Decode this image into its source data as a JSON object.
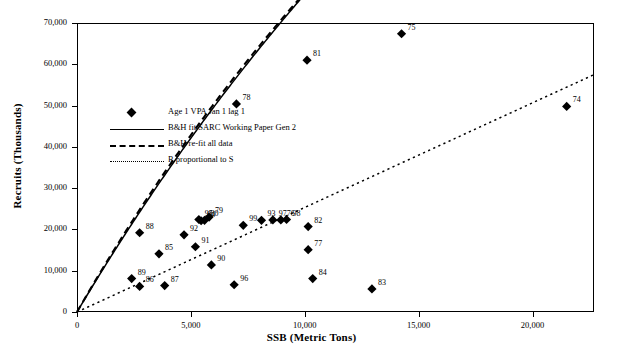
{
  "chart_data": {
    "type": "scatter",
    "title": "",
    "xlabel": "SSB (Metric Tons)",
    "ylabel": "Recruits (Thousands)",
    "xlim": [
      0,
      22700
    ],
    "ylim": [
      0,
      70000
    ],
    "xticks": [
      0,
      5000,
      10000,
      15000,
      20000
    ],
    "xticklabels": [
      "0",
      "5,000",
      "10,000",
      "15,000",
      "20,000"
    ],
    "yticks": [
      0,
      10000,
      20000,
      30000,
      40000,
      50000,
      60000,
      70000
    ],
    "yticklabels": [
      "0",
      "10,000",
      "20,000",
      "30,000",
      "40,000",
      "50,000",
      "60,000",
      "70,000"
    ],
    "grid": false,
    "legend_position": "upper-left-inside",
    "points": [
      {
        "label": "74",
        "x": 21500,
        "y": 49800
      },
      {
        "label": "75",
        "x": 14250,
        "y": 67400
      },
      {
        "label": "76",
        "x": 8950,
        "y": 22300
      },
      {
        "label": "77",
        "x": 10150,
        "y": 15100
      },
      {
        "label": "78",
        "x": 7000,
        "y": 50400
      },
      {
        "label": "79",
        "x": 5800,
        "y": 23000
      },
      {
        "label": "80",
        "x": 5600,
        "y": 22200
      },
      {
        "label": "81",
        "x": 10100,
        "y": 61000
      },
      {
        "label": "82",
        "x": 10150,
        "y": 20700
      },
      {
        "label": "83",
        "x": 12950,
        "y": 5600
      },
      {
        "label": "84",
        "x": 10350,
        "y": 8100
      },
      {
        "label": "85",
        "x": 3600,
        "y": 14100
      },
      {
        "label": "86",
        "x": 2750,
        "y": 6200
      },
      {
        "label": "87",
        "x": 3850,
        "y": 6400
      },
      {
        "label": "88",
        "x": 2750,
        "y": 19200
      },
      {
        "label": "89",
        "x": 2400,
        "y": 8100
      },
      {
        "label": "90",
        "x": 5900,
        "y": 11400
      },
      {
        "label": "91",
        "x": 5200,
        "y": 15800
      },
      {
        "label": "92",
        "x": 4700,
        "y": 18700
      },
      {
        "label": "93",
        "x": 8100,
        "y": 22200
      },
      {
        "label": "94",
        "x": 5450,
        "y": 22100
      },
      {
        "label": "95",
        "x": 5350,
        "y": 22400
      },
      {
        "label": "96",
        "x": 6900,
        "y": 6600
      },
      {
        "label": "97",
        "x": 8600,
        "y": 22300
      },
      {
        "label": "98",
        "x": 9200,
        "y": 22400
      },
      {
        "label": "99",
        "x": 7300,
        "y": 21000
      }
    ],
    "series": [
      {
        "name": "Age 1 VPA Jan 1 lag 1",
        "type": "scatter",
        "marker": "diamond",
        "color": "#000000"
      },
      {
        "name": "B&H fit SARC Working Paper Gen 2",
        "type": "line",
        "style": "solid",
        "color": "#000000",
        "model": "Beverton-Holt",
        "endpoint_value": 33100
      },
      {
        "name": "B&H re-fit all data",
        "type": "line",
        "style": "dashed",
        "color": "#000000",
        "model": "Beverton-Holt",
        "endpoint_value": 31400
      },
      {
        "name": "R proportional to S",
        "type": "line",
        "style": "dotted",
        "color": "#000000",
        "model": "linear",
        "endpoint_value": 57500
      }
    ]
  }
}
